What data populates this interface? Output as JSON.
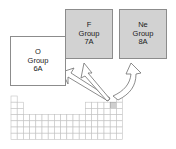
{
  "figure": {
    "background_color": "#ffffff"
  },
  "callout_boxes": [
    {
      "id": "box-o",
      "symbol": "O",
      "group_label": "Group",
      "group_number": "6A",
      "fill_color": "#ffffff",
      "border_color": "#8c8c8c"
    },
    {
      "id": "box-f",
      "symbol": "F",
      "group_label": "Group",
      "group_number": "7A",
      "fill_color": "#d2d2d2",
      "border_color": "#8c8c8c"
    },
    {
      "id": "box-ne",
      "symbol": "Ne",
      "group_label": "Group",
      "group_number": "8A",
      "fill_color": "#d2d2d2",
      "border_color": "#8c8c8c"
    }
  ],
  "arrows": [
    {
      "id": "arrow-to-o",
      "points_to": "O Group 6A",
      "direction": "up-left",
      "outline_color": "#6f6f6f",
      "fill_color": "#ffffff"
    },
    {
      "id": "arrow-to-f",
      "points_to": "F Group 7A",
      "direction": "up",
      "outline_color": "#6f6f6f",
      "fill_color": "#ffffff"
    },
    {
      "id": "arrow-to-ne",
      "points_to": "Ne Group 8A",
      "direction": "up-right",
      "outline_color": "#6f6f6f",
      "fill_color": "#ffffff"
    }
  ],
  "periodic_table": {
    "cell_size": 6.2,
    "origin_x": 11,
    "origin_y": 96,
    "grid_color": "#c2c2c2",
    "highlight_color": "#cfcfcf",
    "rows": [
      {
        "row": 1,
        "cells": [
          1,
          18
        ]
      },
      {
        "row": 2,
        "cells": [
          1,
          2,
          13,
          14,
          15,
          16,
          17,
          18
        ]
      },
      {
        "row": 3,
        "cells": [
          1,
          2,
          13,
          14,
          15,
          16,
          17,
          18
        ]
      },
      {
        "row": 4,
        "cells": [
          1,
          2,
          3,
          4,
          5,
          6,
          7,
          8,
          9,
          10,
          11,
          12,
          13,
          14,
          15,
          16,
          17,
          18
        ]
      },
      {
        "row": 5,
        "cells": [
          1,
          2,
          3,
          4,
          5,
          6,
          7,
          8,
          9,
          10,
          11,
          12,
          13,
          14,
          15,
          16,
          17,
          18
        ]
      },
      {
        "row": 6,
        "cells": [
          1,
          2,
          3,
          4,
          5,
          6,
          7,
          8,
          9,
          10,
          11,
          12,
          13,
          14,
          15,
          16,
          17,
          18
        ]
      },
      {
        "row": 7,
        "cells": [
          1,
          2,
          3,
          4,
          5,
          6,
          7,
          8,
          9,
          10,
          11,
          12,
          13,
          14,
          15,
          16,
          17,
          18
        ]
      }
    ],
    "highlighted_cells": [
      {
        "row": 2,
        "col": 17
      }
    ]
  }
}
